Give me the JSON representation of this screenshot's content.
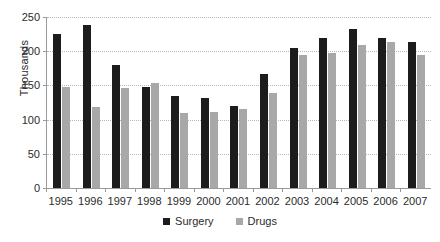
{
  "chart_data": {
    "type": "bar",
    "title": "",
    "xlabel": "",
    "ylabel": "Thousands",
    "ylim": [
      0,
      250
    ],
    "yticks": [
      0,
      50,
      100,
      150,
      200,
      250
    ],
    "grid": true,
    "legend_position": "bottom-center",
    "categories": [
      "1995",
      "1996",
      "1997",
      "1998",
      "1999",
      "2000",
      "2001",
      "2002",
      "2003",
      "2004",
      "2005",
      "2006",
      "2007"
    ],
    "series": [
      {
        "name": "Surgery",
        "color": "#1c1c1c",
        "values": [
          225,
          238,
          180,
          148,
          135,
          131,
          120,
          166,
          205,
          220,
          233,
          219,
          213
        ]
      },
      {
        "name": "Drugs",
        "color": "#a8a8a8",
        "values": [
          148,
          119,
          146,
          153,
          110,
          111,
          115,
          139,
          195,
          198,
          209,
          214,
          194
        ]
      }
    ]
  },
  "axes": {
    "y_title": "Thousands",
    "y_tick_labels": [
      "250",
      "200",
      "150",
      "100",
      "50",
      "0"
    ],
    "x_tick_labels": [
      "1995",
      "1996",
      "1997",
      "1998",
      "1999",
      "2000",
      "2001",
      "2002",
      "2003",
      "2004",
      "2005",
      "2006",
      "2007"
    ]
  },
  "legend": {
    "items": [
      {
        "label": "Surgery",
        "color": "#1c1c1c"
      },
      {
        "label": "Drugs",
        "color": "#a8a8a8"
      }
    ]
  },
  "colors": {
    "surgery": "#1c1c1c",
    "drugs": "#a8a8a8",
    "axis": "#9a9a9a",
    "gridline": "#b9b9b9",
    "text": "#2b2b2b",
    "background": "#ffffff"
  }
}
